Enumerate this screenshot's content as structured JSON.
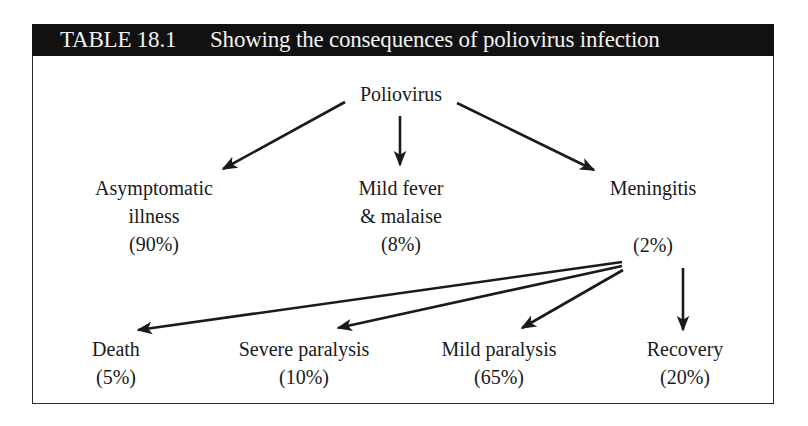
{
  "table": {
    "number": "TABLE 18.1",
    "title": "Showing the consequences of poliovirus infection",
    "header_bg": "#111111",
    "header_fg": "#f2f2f2"
  },
  "diagram": {
    "root": {
      "label": "Poliovirus"
    },
    "level1": [
      {
        "label_lines": [
          "Asymptomatic",
          "illness"
        ],
        "percent": "(90%)"
      },
      {
        "label_lines": [
          "Mild fever",
          "& malaise"
        ],
        "percent": "(8%)"
      },
      {
        "label_lines": [
          "Meningitis"
        ],
        "percent": "(2%)"
      }
    ],
    "meningitis_outcomes": [
      {
        "label": "Death",
        "percent": "(5%)"
      },
      {
        "label": "Severe paralysis",
        "percent": "(10%)"
      },
      {
        "label": "Mild paralysis",
        "percent": "(65%)"
      },
      {
        "label": "Recovery",
        "percent": "(20%)"
      }
    ],
    "edges": [
      {
        "from": "Poliovirus",
        "to": "Asymptomatic illness"
      },
      {
        "from": "Poliovirus",
        "to": "Mild fever & malaise"
      },
      {
        "from": "Poliovirus",
        "to": "Meningitis"
      },
      {
        "from": "Meningitis",
        "to": "Death"
      },
      {
        "from": "Meningitis",
        "to": "Severe paralysis"
      },
      {
        "from": "Meningitis",
        "to": "Mild paralysis"
      },
      {
        "from": "Meningitis",
        "to": "Recovery"
      }
    ]
  }
}
